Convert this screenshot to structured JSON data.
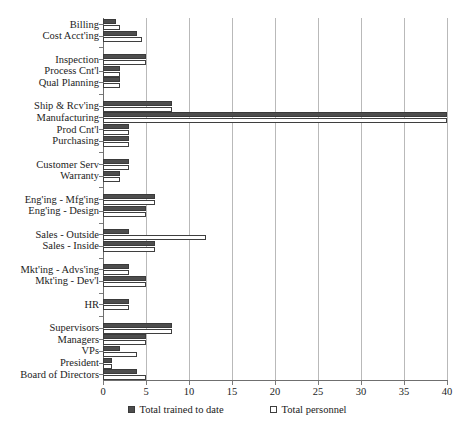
{
  "chart_data": {
    "type": "bar",
    "orientation": "horizontal",
    "title": "",
    "xlabel": "",
    "ylabel": "",
    "xlim": [
      0,
      40
    ],
    "xticks": [
      0,
      5,
      10,
      15,
      20,
      25,
      30,
      35,
      40
    ],
    "grid": true,
    "legend_position": "bottom",
    "categories": [
      "Billing",
      "Cost Acct'ing",
      "",
      "Inspection",
      "Process Cnt'l",
      "Qual Planning",
      "",
      "Ship & Rcv'ing",
      "Manufacturing",
      "Prod Cnt'l",
      "Purchasing",
      "",
      "Customer Serv",
      "Warranty",
      "",
      "Eng'ing - Mfg'ing",
      "Eng'ing - Design",
      "",
      "Sales - Outside",
      "Sales - Inside",
      "",
      "Mkt'ing - Advs'ing",
      "Mkt'ing - Dev'l",
      "",
      "HR",
      "",
      "Supervisors",
      "Managers",
      "VPs",
      "President",
      "Board of Directors"
    ],
    "series": [
      {
        "name": "Total trained to date",
        "color": "#4d4d4d",
        "values": [
          1.5,
          4,
          null,
          5,
          2,
          2,
          null,
          8,
          40,
          3,
          3,
          null,
          3,
          2,
          null,
          6,
          5,
          null,
          3,
          6,
          null,
          3,
          5,
          null,
          3,
          null,
          8,
          5,
          2,
          1,
          4
        ]
      },
      {
        "name": "Total personnel",
        "color": "#ffffff",
        "values": [
          2,
          4.5,
          null,
          5,
          2,
          2,
          null,
          8,
          40,
          3,
          3,
          null,
          3,
          2,
          null,
          6,
          5,
          null,
          12,
          6,
          null,
          3,
          5,
          null,
          3,
          null,
          8,
          5,
          4,
          1,
          5
        ]
      }
    ]
  },
  "legend": {
    "entries": [
      {
        "label": "Total trained to date",
        "marker": "filled-square-icon"
      },
      {
        "label": "Total personnel",
        "marker": "empty-square-icon"
      }
    ]
  }
}
